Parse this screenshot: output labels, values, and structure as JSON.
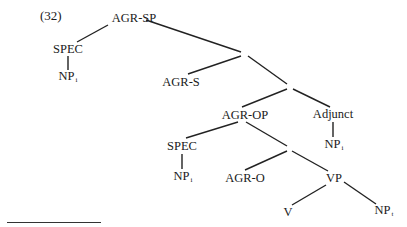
{
  "example_number": "(32)",
  "tree": {
    "nodes": {
      "agr_sp": {
        "label": "AGR-SP"
      },
      "spec_top": {
        "label": "SPEC"
      },
      "np_i_top": {
        "label": "NP",
        "subscript": "i"
      },
      "bar1": {
        "label": "·"
      },
      "agr_s": {
        "label": "AGR-S"
      },
      "bar2": {
        "label": "·"
      },
      "agr_op": {
        "label": "AGR-OP"
      },
      "adjunct": {
        "label": "Adjunct"
      },
      "np_i_adjunct": {
        "label": "NP",
        "subscript": "i"
      },
      "spec_low": {
        "label": "SPEC"
      },
      "np_i_low": {
        "label": "NP",
        "subscript": "i"
      },
      "bar3": {
        "label": "·"
      },
      "agr_o": {
        "label": "AGR-O"
      },
      "vp": {
        "label": "VP"
      },
      "v": {
        "label": "V"
      },
      "np_t": {
        "label": "NP",
        "subscript": "t"
      }
    },
    "edges": [
      [
        "agr_sp",
        "spec_top"
      ],
      [
        "spec_top",
        "np_i_top"
      ],
      [
        "agr_sp",
        "bar1"
      ],
      [
        "bar1",
        "agr_s"
      ],
      [
        "bar1",
        "bar2"
      ],
      [
        "bar2",
        "agr_op"
      ],
      [
        "bar2",
        "adjunct"
      ],
      [
        "adjunct",
        "np_i_adjunct"
      ],
      [
        "agr_op",
        "spec_low"
      ],
      [
        "spec_low",
        "np_i_low"
      ],
      [
        "agr_op",
        "bar3"
      ],
      [
        "bar3",
        "agr_o"
      ],
      [
        "bar3",
        "vp"
      ],
      [
        "vp",
        "v"
      ],
      [
        "vp",
        "np_t"
      ]
    ]
  },
  "footnote_rule": true
}
